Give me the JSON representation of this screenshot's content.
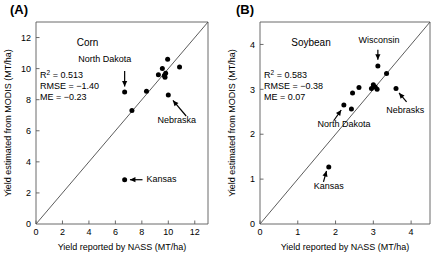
{
  "figure": {
    "panels": [
      {
        "letter": "(A)",
        "series_title": "Corn",
        "xlabel": "Yield reported by NASS (MT/ha)",
        "ylabel": "Yield estimated from MODIS (MT/ha)",
        "xlim": [
          0,
          13
        ],
        "ylim": [
          0,
          13
        ],
        "xticks": [
          0,
          2,
          4,
          6,
          8,
          10,
          12
        ],
        "yticks": [
          2,
          4,
          6,
          8,
          10,
          12
        ],
        "stats": {
          "r2_label": "R",
          "r2_sup": "2",
          "r2_value": " = 0.513",
          "rmse": "RMSE = −1.40",
          "me": "ME = −0.23"
        },
        "chart_data": {
          "type": "scatter",
          "title": "Corn",
          "xlabel": "Yield reported by NASS (MT/ha)",
          "ylabel": "Yield estimated from MODIS (MT/ha)",
          "xlim": [
            0,
            13
          ],
          "ylim": [
            0,
            13
          ],
          "grid": false,
          "reference_line": {
            "type": "1:1",
            "from": [
              0,
              0
            ],
            "to": [
              13,
              13
            ]
          },
          "points": [
            {
              "x": 6.7,
              "y": 8.5,
              "label": "North Dakota"
            },
            {
              "x": 6.7,
              "y": 2.85,
              "label": "Kansas"
            },
            {
              "x": 7.25,
              "y": 7.3,
              "label": ""
            },
            {
              "x": 8.35,
              "y": 8.55,
              "label": ""
            },
            {
              "x": 9.25,
              "y": 9.6,
              "label": ""
            },
            {
              "x": 9.55,
              "y": 10.0,
              "label": ""
            },
            {
              "x": 9.7,
              "y": 9.55,
              "label": ""
            },
            {
              "x": 9.75,
              "y": 9.45,
              "label": ""
            },
            {
              "x": 9.8,
              "y": 9.7,
              "label": ""
            },
            {
              "x": 9.95,
              "y": 10.6,
              "label": ""
            },
            {
              "x": 10.0,
              "y": 8.3,
              "label": "Nebraska"
            },
            {
              "x": 10.85,
              "y": 10.1,
              "label": ""
            }
          ]
        },
        "annotations": [
          {
            "label": "North Dakota",
            "text_x": 5.2,
            "text_y": 10.45,
            "arrow_from": [
              6.7,
              9.85
            ],
            "arrow_to": [
              6.7,
              8.85
            ],
            "align": "middle"
          },
          {
            "label": "Nebraska",
            "text_x": 12.1,
            "text_y": 6.5,
            "arrow_from": [
              11.35,
              6.95
            ],
            "arrow_to": [
              10.35,
              7.95
            ],
            "align": "end"
          },
          {
            "label": "Kansas",
            "text_x": 8.35,
            "text_y": 2.7,
            "arrow_from": [
              8.05,
              2.85
            ],
            "arrow_to": [
              7.1,
              2.85
            ],
            "align": "start"
          }
        ]
      },
      {
        "letter": "(B)",
        "series_title": "Soybean",
        "xlabel": "Yield reported by NASS (MT/ha)",
        "ylabel": "Yield estimated from MODIS (MT/ha)",
        "xlim": [
          0,
          4.5
        ],
        "ylim": [
          0,
          4.5
        ],
        "xticks": [
          0,
          1,
          2,
          3,
          4
        ],
        "yticks": [
          1,
          2,
          3,
          4
        ],
        "stats": {
          "r2_label": "R",
          "r2_sup": "2",
          "r2_value": " = 0.583",
          "rmse": "RMSE = −0.38",
          "me": "ME = 0.07"
        },
        "chart_data": {
          "type": "scatter",
          "title": "Soybean",
          "xlabel": "Yield reported by NASS (MT/ha)",
          "ylabel": "Yield estimated from MODIS (MT/ha)",
          "xlim": [
            0,
            4.5
          ],
          "ylim": [
            0,
            4.5
          ],
          "grid": false,
          "reference_line": {
            "type": "1:1",
            "from": [
              0,
              0
            ],
            "to": [
              4.5,
              4.5
            ]
          },
          "points": [
            {
              "x": 1.82,
              "y": 1.27,
              "label": "Kansas"
            },
            {
              "x": 2.22,
              "y": 2.65,
              "label": "North Dakota"
            },
            {
              "x": 2.42,
              "y": 2.56,
              "label": ""
            },
            {
              "x": 2.45,
              "y": 2.92,
              "label": ""
            },
            {
              "x": 2.62,
              "y": 3.04,
              "label": ""
            },
            {
              "x": 2.95,
              "y": 3.02,
              "label": ""
            },
            {
              "x": 3.0,
              "y": 3.1,
              "label": ""
            },
            {
              "x": 3.05,
              "y": 3.05,
              "label": ""
            },
            {
              "x": 3.1,
              "y": 3.0,
              "label": ""
            },
            {
              "x": 3.12,
              "y": 3.52,
              "label": "Wisconsin"
            },
            {
              "x": 3.35,
              "y": 3.35,
              "label": ""
            },
            {
              "x": 3.6,
              "y": 3.02,
              "label": "Nebrasks"
            }
          ]
        },
        "annotations": [
          {
            "label": "Wisconsin",
            "text_x": 3.15,
            "text_y": 4.03,
            "arrow_from": [
              3.12,
              3.88
            ],
            "arrow_to": [
              3.12,
              3.66
            ],
            "align": "middle"
          },
          {
            "label": "Nebrasks",
            "text_x": 4.35,
            "text_y": 2.48,
            "arrow_from": [
              3.88,
              2.72
            ],
            "arrow_to": [
              3.68,
              2.92
            ],
            "align": "end"
          },
          {
            "label": "North Dakota",
            "text_x": 1.52,
            "text_y": 2.16,
            "arrow_from": [
              1.95,
              2.3
            ],
            "arrow_to": [
              2.15,
              2.54
            ],
            "align": "start"
          },
          {
            "label": "Kansas",
            "text_x": 1.82,
            "text_y": 0.78,
            "arrow_from": [
              1.68,
              0.94
            ],
            "arrow_to": [
              1.76,
              1.18
            ],
            "align": "middle"
          }
        ]
      }
    ]
  }
}
